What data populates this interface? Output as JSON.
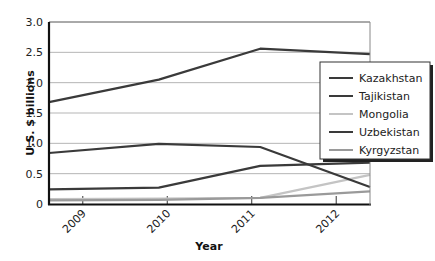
{
  "chart_data": {
    "type": "line",
    "title": "",
    "xlabel": "Year",
    "ylabel": "U.S. $ billions",
    "ylim": [
      0,
      3.0
    ],
    "y_ticks": [
      "0",
      "0.5",
      "1.0",
      "1.5",
      "2.0",
      "2.5",
      "3.0"
    ],
    "x_ticks": [
      "2009",
      "2010",
      "2011",
      "2012"
    ],
    "x": [
      2008.6,
      2009.9,
      2011.1,
      2012.4
    ],
    "grid": "horizontal",
    "legend_position": "right, inside upper",
    "series": [
      {
        "name": "Kazakhstan",
        "color": "#3a3a3a",
        "values": [
          1.68,
          2.05,
          2.56,
          2.47
        ]
      },
      {
        "name": "Tajikistan",
        "color": "#3a3a3a",
        "values": [
          0.84,
          0.99,
          0.94,
          0.28
        ]
      },
      {
        "name": "Mongolia",
        "color": "#c4c4c4",
        "values": [
          0.08,
          0.09,
          0.1,
          0.48
        ]
      },
      {
        "name": "Uzbekistan",
        "color": "#3a3a3a",
        "values": [
          0.24,
          0.27,
          0.63,
          0.68
        ]
      },
      {
        "name": "Kyrgyzstan",
        "color": "#9a9a9a",
        "values": [
          0.06,
          0.07,
          0.1,
          0.21
        ]
      }
    ]
  }
}
